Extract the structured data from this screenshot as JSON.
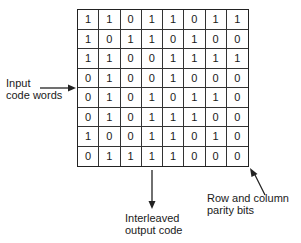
{
  "diagram": {
    "grid": [
      [
        1,
        1,
        0,
        1,
        1,
        0,
        1,
        1
      ],
      [
        1,
        0,
        1,
        1,
        0,
        1,
        0,
        0
      ],
      [
        1,
        1,
        0,
        0,
        1,
        1,
        1,
        1
      ],
      [
        0,
        1,
        0,
        0,
        1,
        0,
        0,
        0
      ],
      [
        0,
        1,
        0,
        1,
        0,
        1,
        1,
        0
      ],
      [
        0,
        1,
        0,
        1,
        1,
        1,
        0,
        0
      ],
      [
        1,
        0,
        0,
        1,
        1,
        0,
        1,
        0
      ],
      [
        0,
        1,
        1,
        1,
        1,
        0,
        0,
        0
      ]
    ],
    "labels": {
      "input_line1": "Input",
      "input_line2": "code words",
      "output_line1": "Interleaved",
      "output_line2": "output code",
      "parity_line1": "Row and column",
      "parity_line2": "parity bits"
    }
  }
}
